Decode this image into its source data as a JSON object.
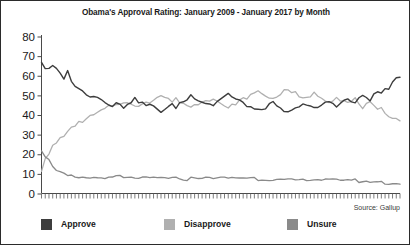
{
  "chart_data": {
    "type": "line",
    "title": "Obama's Approval Rating: January 2009 - January 2017 by Month",
    "xlabel": "",
    "ylabel": "",
    "ylim": [
      0,
      80
    ],
    "yticks": [
      0,
      10,
      20,
      30,
      40,
      50,
      60,
      70,
      80
    ],
    "xlim": [
      0,
      96
    ],
    "grid": false,
    "legend_position": "bottom",
    "source": "Source: Gallup",
    "x_axis_note": "Monthly tick marks, January 2009 through January 2017, unlabeled",
    "x_tick_count": 97,
    "colors": {
      "approve": "#3d3d3d",
      "disapprove": "#b0b0b0",
      "unsure": "#8a8a8a"
    },
    "series": [
      {
        "name": "Approve",
        "color": "#3d3d3d",
        "values": [
          67,
          64,
          63,
          65,
          63,
          61,
          59,
          62,
          58,
          55,
          53,
          52,
          51,
          50,
          50,
          49,
          48,
          47,
          46,
          45,
          46,
          45,
          44,
          46,
          47,
          48,
          47,
          46,
          45,
          45,
          44,
          43,
          42,
          43,
          44,
          45,
          44,
          46,
          47,
          48,
          50,
          49,
          48,
          47,
          46,
          46,
          45,
          47,
          48,
          50,
          51,
          49,
          48,
          47,
          46,
          45,
          44,
          43,
          42,
          43,
          44,
          45,
          46,
          44,
          43,
          42,
          41,
          42,
          43,
          45,
          46,
          45,
          44,
          43,
          44,
          45,
          46,
          47,
          46,
          45,
          46,
          47,
          48,
          47,
          46,
          48,
          50,
          49,
          48,
          50,
          52,
          51,
          53,
          54,
          56,
          58,
          59
        ]
      },
      {
        "name": "Disapprove",
        "color": "#b0b0b0",
        "values": [
          12,
          17,
          20,
          24,
          26,
          28,
          30,
          31,
          33,
          35,
          36,
          37,
          38,
          39,
          40,
          41,
          42,
          43,
          44,
          45,
          45,
          46,
          47,
          46,
          45,
          44,
          45,
          46,
          47,
          47,
          48,
          49,
          50,
          49,
          48,
          47,
          48,
          47,
          46,
          45,
          44,
          45,
          46,
          47,
          48,
          48,
          49,
          47,
          46,
          44,
          43,
          45,
          46,
          47,
          48,
          49,
          50,
          51,
          52,
          51,
          50,
          49,
          48,
          50,
          51,
          52,
          53,
          52,
          51,
          49,
          48,
          49,
          50,
          51,
          50,
          49,
          48,
          47,
          48,
          49,
          48,
          47,
          46,
          47,
          48,
          46,
          44,
          45,
          46,
          44,
          42,
          43,
          41,
          40,
          39,
          38,
          37
        ]
      },
      {
        "name": "Unsure",
        "color": "#8a8a8a",
        "values": [
          22,
          19,
          17,
          14,
          12,
          11,
          10,
          9,
          9,
          8,
          8,
          8,
          8,
          8,
          8,
          8,
          8,
          8,
          8,
          8,
          9,
          9,
          8,
          8,
          8,
          8,
          8,
          8,
          8,
          8,
          8,
          8,
          8,
          8,
          8,
          8,
          8,
          7,
          7,
          7,
          8,
          8,
          8,
          8,
          8,
          8,
          8,
          8,
          8,
          8,
          8,
          8,
          8,
          8,
          8,
          8,
          8,
          8,
          7,
          7,
          7,
          7,
          7,
          7,
          7,
          7,
          7,
          7,
          7,
          7,
          7,
          7,
          7,
          7,
          7,
          7,
          7,
          7,
          7,
          7,
          7,
          7,
          7,
          7,
          7,
          6,
          6,
          6,
          6,
          6,
          6,
          6,
          5,
          5,
          5,
          5,
          5
        ]
      }
    ]
  },
  "legend": {
    "approve": "Approve",
    "disapprove": "Disapprove",
    "unsure": "Unsure"
  }
}
